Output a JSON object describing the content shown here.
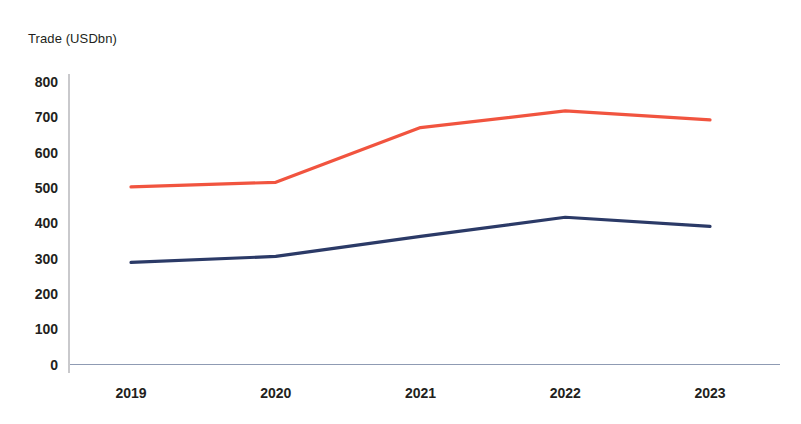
{
  "chart_data": {
    "type": "line",
    "title": "",
    "ylabel": "Trade (USDbn)",
    "xlabel": "",
    "categories": [
      "2019",
      "2020",
      "2021",
      "2022",
      "2023"
    ],
    "ylim": [
      0,
      800
    ],
    "yticks": [
      0,
      100,
      200,
      300,
      400,
      500,
      600,
      700,
      800
    ],
    "ytick_labels": [
      "0",
      "100",
      "200",
      "300",
      "400",
      "500",
      "600",
      "700",
      "800"
    ],
    "grid": false,
    "legend": "none",
    "series": [
      {
        "name": "series-red",
        "color": "#f1543f",
        "values": [
          503,
          516,
          671,
          718,
          693
        ]
      },
      {
        "name": "series-navy",
        "color": "#2b3a67",
        "values": [
          289,
          306,
          363,
          417,
          391
        ]
      }
    ],
    "axis_color": "#c9c9cc",
    "baseline_color": "#8f9bb3",
    "text_color": "#231f20",
    "background": "#ffffff"
  }
}
